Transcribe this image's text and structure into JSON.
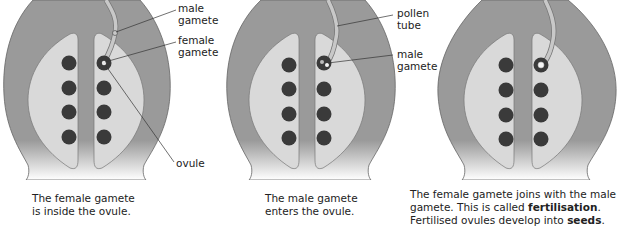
{
  "colors": {
    "flower_outer": "#9a9a9a",
    "ovary_inner": "#d9d9d9",
    "ovule": "#3a3a3a",
    "pollen_tube": "#c8c8c8"
  },
  "panels": [
    {
      "labels": {
        "male_gamete": [
          "male",
          "gamete"
        ],
        "female_gamete": [
          "female",
          "gamete"
        ],
        "ovule": "ovule"
      },
      "caption": [
        "The female gamete",
        "is inside the ovule."
      ]
    },
    {
      "labels": {
        "pollen_tube": [
          "pollen",
          "tube"
        ],
        "male_gamete": [
          "male",
          "gamete"
        ]
      },
      "caption": [
        "The male gamete",
        "enters the ovule."
      ]
    },
    {
      "caption_parts": {
        "line1": "The female gamete joins with the male",
        "line2_pre": "gamete. This is called ",
        "line2_bold": "fertilisation",
        "line2_post": ".",
        "line3_pre": "Fertilised ovules develop into ",
        "line3_bold": "seeds",
        "line3_post": "."
      }
    }
  ]
}
